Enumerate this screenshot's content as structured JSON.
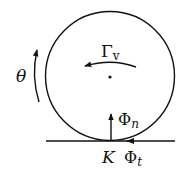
{
  "diagram": {
    "title": "",
    "colors": {
      "stroke": "#111111",
      "background": "#ffffff"
    },
    "labels": {
      "theta": "θ",
      "gamma_main": "Γ",
      "gamma_sub": "v",
      "phi_n_main": "Φ",
      "phi_n_sub": "n",
      "contact_point": "K",
      "phi_t_main": "Φ",
      "phi_t_sub": "t"
    },
    "elements": [
      {
        "id": "wheel",
        "type": "circle",
        "description": "rolling disc/wheel"
      },
      {
        "id": "ground",
        "type": "line",
        "description": "ground surface"
      },
      {
        "id": "center",
        "type": "point",
        "description": "center of wheel"
      },
      {
        "id": "theta-arrow",
        "type": "arc-arrow",
        "description": "rotation angle, counter-clockwise",
        "label": "θ"
      },
      {
        "id": "gamma-arrow",
        "type": "arc-arrow",
        "description": "torque Γv, pointing left",
        "label": "Γv"
      },
      {
        "id": "phi-n-arrow",
        "type": "arrow",
        "description": "normal force Φn, pointing up",
        "label": "Φn"
      },
      {
        "id": "phi-t-arrow",
        "type": "arrow",
        "description": "tangential force Φt, pointing left along ground",
        "label": "Φt"
      }
    ]
  }
}
